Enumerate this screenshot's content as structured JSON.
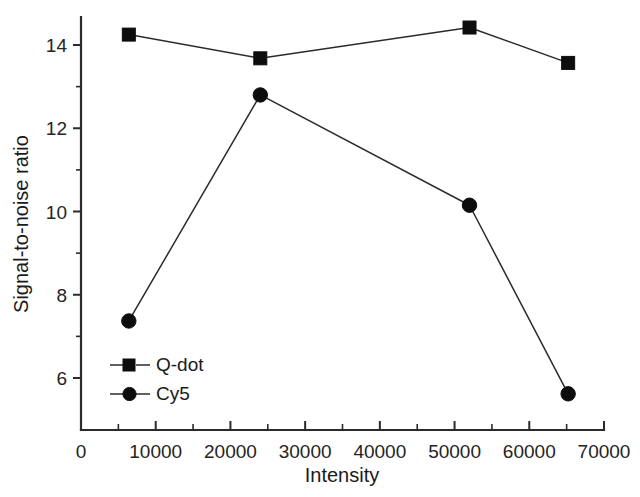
{
  "chart_data": {
    "type": "line",
    "title": "",
    "xlabel": "Intensity",
    "ylabel": "Signal-to-noise ratio",
    "xlim": [
      0,
      70000
    ],
    "ylim": [
      4.9,
      14.9
    ],
    "grid": false,
    "legend_position": "lower-left-inside",
    "x_ticks": [
      0,
      10000,
      20000,
      30000,
      40000,
      50000,
      60000,
      70000
    ],
    "x_tick_labels": [
      "0",
      "10000",
      "20000",
      "30000",
      "40000",
      "50000",
      "60000",
      "70000"
    ],
    "x_minor_ticks": [
      5000,
      15000,
      25000,
      35000,
      45000,
      55000,
      65000
    ],
    "y_ticks": [
      6,
      8,
      10,
      12,
      14
    ],
    "y_tick_labels": [
      "6",
      "8",
      "10",
      "12",
      "14"
    ],
    "y_minor_ticks": [
      7,
      9,
      11,
      13
    ],
    "series": [
      {
        "name": "Q-dot",
        "marker": "square",
        "color": "#0d0d0d",
        "x": [
          6400,
          24000,
          52000,
          65200
        ],
        "values": [
          14.25,
          13.68,
          14.42,
          13.57
        ]
      },
      {
        "name": "Cy5",
        "marker": "circle",
        "color": "#0d0d0d",
        "x": [
          6400,
          24000,
          52000,
          65200
        ],
        "values": [
          7.37,
          12.8,
          10.15,
          5.62
        ]
      }
    ],
    "legend": [
      {
        "label": "Q-dot",
        "marker": "square"
      },
      {
        "label": "Cy5",
        "marker": "circle"
      }
    ]
  }
}
